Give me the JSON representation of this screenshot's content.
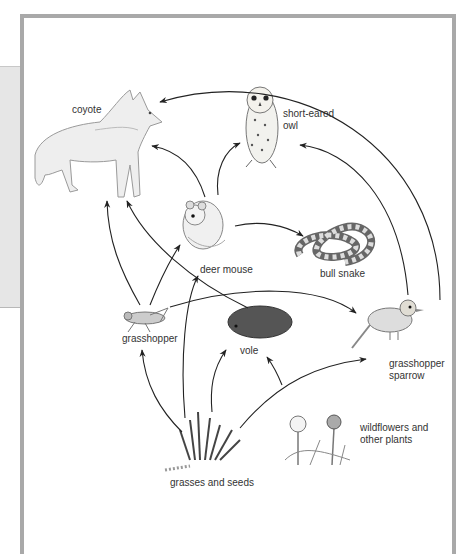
{
  "diagram": {
    "type": "food-web",
    "organisms": [
      {
        "id": "coyote",
        "label": "coyote"
      },
      {
        "id": "owl",
        "label": "short-eared\nowl"
      },
      {
        "id": "mouse",
        "label": "deer mouse"
      },
      {
        "id": "snake",
        "label": "bull snake"
      },
      {
        "id": "grasshopper",
        "label": "grasshopper"
      },
      {
        "id": "vole",
        "label": "vole"
      },
      {
        "id": "sparrow",
        "label": "grasshopper\nsparrow"
      },
      {
        "id": "grasses",
        "label": "grasses and seeds"
      },
      {
        "id": "wildflowers",
        "label": "wildflowers and\nother plants"
      }
    ],
    "edges": [
      {
        "from": "sparrow",
        "to": "coyote"
      },
      {
        "from": "mouse",
        "to": "coyote"
      },
      {
        "from": "mouse",
        "to": "owl"
      },
      {
        "from": "mouse",
        "to": "snake"
      },
      {
        "from": "grasshopper",
        "to": "coyote"
      },
      {
        "from": "vole",
        "to": "coyote"
      },
      {
        "from": "grasshopper",
        "to": "mouse"
      },
      {
        "from": "grasshopper",
        "to": "sparrow"
      },
      {
        "from": "sparrow",
        "to": "owl"
      },
      {
        "from": "grasses",
        "to": "grasshopper"
      },
      {
        "from": "grasses",
        "to": "mouse"
      },
      {
        "from": "grasses",
        "to": "vole"
      },
      {
        "from": "grasses",
        "to": "sparrow"
      },
      {
        "from": "wildflowers",
        "to": "vole"
      }
    ]
  },
  "colors": {
    "frame": "#a9a9a9",
    "panel": "#e6e6e6",
    "arrow": "#222222",
    "label": "#333333"
  }
}
